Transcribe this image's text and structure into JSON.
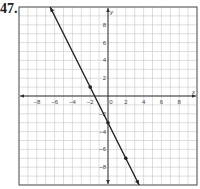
{
  "problem": {
    "number": "47."
  },
  "chart_data": {
    "type": "line",
    "title": "",
    "xlabel": "x",
    "ylabel": "y",
    "xlim": [
      -10,
      10
    ],
    "ylim": [
      -10,
      10
    ],
    "grid": true,
    "x_ticks": [
      -8,
      -6,
      -4,
      -2,
      0,
      2,
      4,
      6,
      8
    ],
    "y_ticks": [
      8,
      6,
      4,
      2,
      -2,
      -4,
      -6,
      -8
    ],
    "series": [
      {
        "name": "y = -2x - 3",
        "equation": "y = -2x - 3",
        "slope": -2,
        "intercept": -3,
        "x": [
          -6.5,
          3.5
        ],
        "y": [
          10,
          -10
        ],
        "marked_points": [
          [
            -2,
            1
          ],
          [
            0,
            -3
          ],
          [
            2,
            -7
          ]
        ],
        "arrows": "both",
        "color": "#222222"
      }
    ]
  },
  "colors": {
    "grid": "#c8c8c8",
    "axis": "#333333",
    "border": "#555555",
    "line": "#222222"
  }
}
